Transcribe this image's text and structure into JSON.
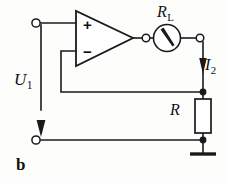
{
  "figure": {
    "label": "b",
    "caption": "Operational amplifier voltage-to-current converter with load R_L and sense resistor R"
  },
  "labels": {
    "input_voltage": "U",
    "input_voltage_sub": "1",
    "output_current": "I",
    "output_current_sub": "2",
    "load_resistor": "R",
    "load_resistor_sub": "L",
    "sense_resistor": "R"
  },
  "opamp": {
    "noninverting_sign": "+",
    "inverting_sign": "−",
    "name": "operational-amplifier"
  },
  "components": [
    {
      "id": "opamp",
      "type": "operational-amplifier",
      "label": ""
    },
    {
      "id": "meter",
      "type": "moving-coil-meter",
      "label": "R_L"
    },
    {
      "id": "resistor-r",
      "type": "resistor",
      "label": "R"
    },
    {
      "id": "ground",
      "type": "ground",
      "label": ""
    }
  ],
  "terminals": [
    {
      "id": "input-top",
      "type": "open-terminal"
    },
    {
      "id": "input-bottom",
      "type": "open-terminal"
    },
    {
      "id": "opamp-output-node",
      "type": "open-terminal"
    },
    {
      "id": "output-right-node",
      "type": "open-terminal"
    }
  ],
  "junctions": [
    {
      "id": "junction-feedback",
      "type": "filled-node"
    },
    {
      "id": "junction-ground",
      "type": "filled-node"
    }
  ],
  "colors": {
    "line": "#1a1a1a",
    "background": "#fdfdfc",
    "fill": "#ffffff"
  }
}
